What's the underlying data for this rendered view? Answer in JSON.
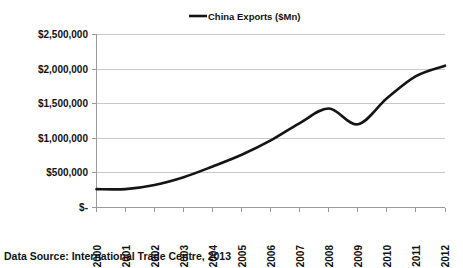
{
  "chart_data": {
    "type": "line",
    "title": "",
    "subtitle": "",
    "xlabel": "",
    "ylabel": "",
    "categories": [
      "2000",
      "2001",
      "2002",
      "2003",
      "2004",
      "2005",
      "2006",
      "2007",
      "2008",
      "2009",
      "2010",
      "2011",
      "2012"
    ],
    "x": [
      2000,
      2001,
      2002,
      2003,
      2004,
      2005,
      2006,
      2007,
      2008,
      2009,
      2010,
      2011,
      2012
    ],
    "series": [
      {
        "name": "China Exports ($Mn)",
        "color": "#141414",
        "values": [
          265000,
          266000,
          326000,
          438000,
          593000,
          762000,
          969000,
          1220000,
          1430000,
          1202000,
          1578000,
          1899000,
          2049000
        ]
      }
    ],
    "ylim": [
      0,
      2500000
    ],
    "ytick_values": [
      0,
      500000,
      1000000,
      1500000,
      2000000,
      2500000
    ],
    "ytick_labels": [
      "$-",
      "$500,000",
      "$1,000,000",
      "$1,500,000",
      "$2,000,000",
      "$2,500,000"
    ],
    "xtick_labels": [
      "2000",
      "2001",
      "2002",
      "2003",
      "2004",
      "2005",
      "2006",
      "2007",
      "2008",
      "2009",
      "2010",
      "2011",
      "2012"
    ],
    "grid": true,
    "grid_axis": "y",
    "legend": {
      "position": "top-center",
      "entries": [
        "China Exports ($Mn)"
      ]
    },
    "annotations": [],
    "source_note": "Data Source: International Trade Centre, 2013"
  },
  "legend": {
    "entry_label": "China Exports ($Mn)"
  },
  "footer": {
    "source_text": "Data Source: International Trade Centre, 2013"
  },
  "colors": {
    "series_line": "#141414",
    "gridline": "#c9c9c9",
    "axis": "#9a9a9a",
    "text": "#111111",
    "background": "#ffffff"
  }
}
